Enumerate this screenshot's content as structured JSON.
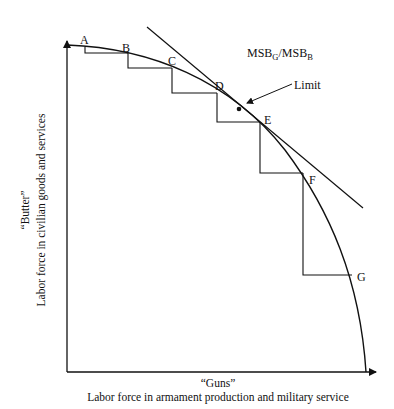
{
  "diagram": {
    "type": "production-possibility-frontier",
    "y_axis": {
      "title": "“Butter”",
      "label": "Labor force in civilian goods and services"
    },
    "x_axis": {
      "title": "“Guns”",
      "label": "Labor force in armament production and military service"
    },
    "points": [
      {
        "label": "A"
      },
      {
        "label": "B"
      },
      {
        "label": "C"
      },
      {
        "label": "D"
      },
      {
        "label": "E"
      },
      {
        "label": "F"
      },
      {
        "label": "G"
      }
    ],
    "tangent_label": {
      "main1": "MSB",
      "sub1": "G",
      "slash": "/MSB",
      "sub2": "B"
    },
    "limit_label": "Limit",
    "colors": {
      "line": "#111111",
      "background": "#ffffff"
    }
  }
}
